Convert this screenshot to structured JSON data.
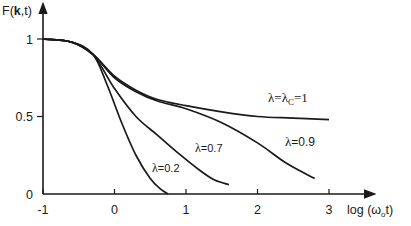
{
  "chart_data": {
    "type": "line",
    "title": "",
    "ylabel": "F(k,t)",
    "ylabel_parts": {
      "pre": "F(",
      "bold": "k",
      "post": ",t)"
    },
    "xlabel": "log (ω₀t)",
    "xlabel_parts": {
      "pre": "log (ω",
      "sub": "o",
      "post": "t)"
    },
    "xlim": [
      -1,
      3.3
    ],
    "ylim": [
      0,
      1.1
    ],
    "x_ticks": [
      -1,
      0,
      1,
      2,
      3
    ],
    "x_tick_labels": [
      "-1",
      "0",
      "1",
      "2",
      "3"
    ],
    "y_ticks": [
      0,
      0.5,
      1
    ],
    "y_tick_labels": [
      "0",
      "0.5",
      "1"
    ],
    "grid": false,
    "legend": "inline annotations",
    "series": [
      {
        "name": "λ=λc=1",
        "label": "λ=λ",
        "label_sub": "C",
        "label_post": "=1",
        "x": [
          -1,
          -0.6,
          -0.3,
          0,
          0.3,
          0.6,
          1.0,
          1.5,
          2.0,
          2.5,
          3.0
        ],
        "y": [
          1.0,
          0.98,
          0.9,
          0.76,
          0.67,
          0.61,
          0.57,
          0.53,
          0.5,
          0.49,
          0.48
        ]
      },
      {
        "name": "λ=0.9",
        "label": "λ=0.9",
        "x": [
          -1,
          -0.6,
          -0.3,
          0,
          0.3,
          0.6,
          1.0,
          1.5,
          2.0,
          2.4,
          2.8
        ],
        "y": [
          1.0,
          0.98,
          0.9,
          0.75,
          0.66,
          0.6,
          0.55,
          0.46,
          0.33,
          0.2,
          0.1
        ]
      },
      {
        "name": "λ=0.7",
        "label": "λ=0.7",
        "x": [
          -1,
          -0.6,
          -0.3,
          0,
          0.3,
          0.6,
          0.9,
          1.2,
          1.4,
          1.6
        ],
        "y": [
          1.0,
          0.98,
          0.9,
          0.68,
          0.5,
          0.38,
          0.26,
          0.15,
          0.09,
          0.06
        ]
      },
      {
        "name": "λ=0.2",
        "label": "λ=0.2",
        "x": [
          -1,
          -0.6,
          -0.3,
          -0.1,
          0.1,
          0.3,
          0.5,
          0.65,
          0.75
        ],
        "y": [
          1.0,
          0.98,
          0.9,
          0.7,
          0.46,
          0.25,
          0.1,
          0.03,
          0.0
        ]
      }
    ],
    "annotations": [
      {
        "text": "λ=λC=1",
        "x": 2.3,
        "y": 0.58
      },
      {
        "text": "λ=0.9",
        "x": 2.45,
        "y": 0.3
      },
      {
        "text": "λ=0.7",
        "x": 1.05,
        "y": 0.38
      },
      {
        "text": "λ=0.2",
        "x": 0.45,
        "y": 0.2
      }
    ]
  }
}
